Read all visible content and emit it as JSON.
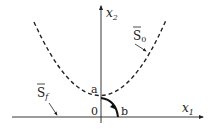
{
  "diagram": {
    "type": "phase-plane",
    "axes": {
      "x_label": "x",
      "x_subscript": "1",
      "y_label": "x",
      "y_subscript": "2"
    },
    "origin_label": "0",
    "points": [
      {
        "id": "a",
        "label": "a"
      },
      {
        "id": "b",
        "label": "b"
      }
    ],
    "curves": [
      {
        "id": "S0",
        "label": "S",
        "subscript": "0",
        "overline": true,
        "style": "dashed",
        "shape": "parabola"
      },
      {
        "id": "Sf",
        "label": "S",
        "subscript": "f",
        "overline": true,
        "style": "none-axis",
        "target": "x1-axis"
      }
    ],
    "trajectory": {
      "from": "a",
      "to": "b",
      "style": "solid",
      "direction": "a-to-b"
    },
    "colors": {
      "stroke": "#222222",
      "background": "#ffffff"
    }
  }
}
